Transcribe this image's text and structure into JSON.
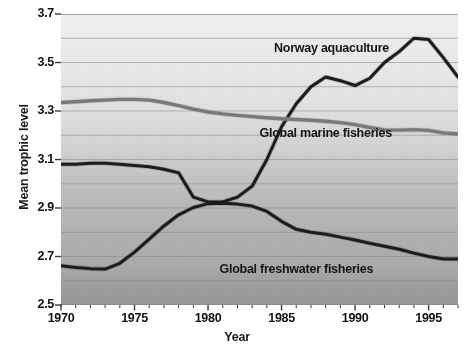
{
  "chart_data": {
    "type": "line",
    "title": "",
    "xlabel": "Year",
    "ylabel": "Mean trophic level",
    "xlim": [
      1970,
      1997
    ],
    "ylim": [
      2.5,
      3.7
    ],
    "ytick_step": 0.1,
    "grid": true,
    "gridlines_y": [
      2.5,
      2.6,
      2.7,
      2.8,
      2.9,
      3.0,
      3.1,
      3.2,
      3.3,
      3.4,
      3.5,
      3.6,
      3.7
    ],
    "ytick_labels": [
      "3.7",
      "3.5",
      "3.3",
      "3.1",
      "2.9",
      "2.7",
      "2.5"
    ],
    "ytick_values": [
      3.7,
      3.5,
      3.3,
      3.1,
      2.9,
      2.7,
      2.5
    ],
    "xtick_labels": [
      "1970",
      "1975",
      "1980",
      "1985",
      "1990",
      "1995"
    ],
    "xtick_values": [
      1970,
      1975,
      1980,
      1985,
      1990,
      1995
    ],
    "xtick_minor_step": 1,
    "legend_position": "inline-annotations",
    "x": [
      1970,
      1971,
      1972,
      1973,
      1974,
      1975,
      1976,
      1977,
      1978,
      1979,
      1980,
      1981,
      1982,
      1983,
      1984,
      1985,
      1986,
      1987,
      1988,
      1989,
      1990,
      1991,
      1992,
      1993,
      1994,
      1995,
      1996,
      1997
    ],
    "series": [
      {
        "name": "Norway aquaculture",
        "color": "#1c1c1c",
        "width": 3.0,
        "label_x": 1988.4,
        "label_y": 3.555,
        "values": [
          3.08,
          3.08,
          3.085,
          3.085,
          3.08,
          3.075,
          3.07,
          3.06,
          3.045,
          2.945,
          2.925,
          2.925,
          2.945,
          2.99,
          3.1,
          3.235,
          3.33,
          3.4,
          3.44,
          3.425,
          3.405,
          3.435,
          3.5,
          3.545,
          3.6,
          3.595,
          3.52,
          3.44
        ]
      },
      {
        "name": "Global marine fisheries",
        "color": "#7b7b7b",
        "width": 3.4,
        "label_x": 1988.0,
        "label_y": 3.205,
        "values": [
          3.335,
          3.338,
          3.342,
          3.345,
          3.348,
          3.348,
          3.345,
          3.335,
          3.322,
          3.308,
          3.296,
          3.288,
          3.282,
          3.277,
          3.272,
          3.268,
          3.265,
          3.262,
          3.258,
          3.252,
          3.244,
          3.232,
          3.222,
          3.221,
          3.223,
          3.22,
          3.21,
          3.205
        ]
      },
      {
        "name": "Global freshwater fisheries",
        "color": "#1c1c1c",
        "width": 3.0,
        "label_x": 1986.0,
        "label_y": 2.645,
        "values": [
          2.662,
          2.655,
          2.65,
          2.648,
          2.672,
          2.718,
          2.772,
          2.826,
          2.872,
          2.902,
          2.918,
          2.92,
          2.916,
          2.908,
          2.886,
          2.845,
          2.812,
          2.8,
          2.792,
          2.78,
          2.768,
          2.755,
          2.742,
          2.73,
          2.714,
          2.7,
          2.69,
          2.69
        ]
      }
    ]
  },
  "background": {
    "plot_fill_top": "#eeeeee",
    "plot_fill_bottom": "#9f9f9f",
    "gridline_color": "#8a8a8a",
    "page_bg": "#ffffff"
  }
}
